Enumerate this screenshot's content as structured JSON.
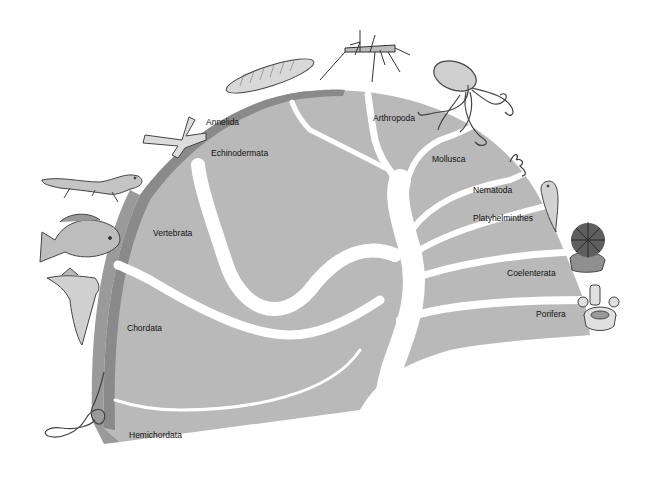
{
  "diagram": {
    "type": "phylogenetic-fan",
    "colors": {
      "fan_fill": "#b9b9b9",
      "outer_band": "#8a8a8a",
      "side_face": "#9e9e9e",
      "branch": "#ffffff",
      "background": "#ffffff"
    },
    "labels": {
      "annelida": "Annelida",
      "arthropoda": "Arthropoda",
      "echinodermata": "Echinodermata",
      "mollusca": "Mollusca",
      "nematoda": "Nematoda",
      "platyhelminthes": "Platyhelminthes",
      "vertebrata": "Vertebrata",
      "coelenterata": "Coelenterata",
      "chordata": "Chordata",
      "porifera": "Porifera",
      "hemichordata": "Hemichordata"
    },
    "illustrations": [
      {
        "name": "earthworm",
        "phylum": "Annelida"
      },
      {
        "name": "mosquito",
        "phylum": "Arthropoda"
      },
      {
        "name": "octopus",
        "phylum": "Mollusca"
      },
      {
        "name": "starfish",
        "phylum": "Echinodermata"
      },
      {
        "name": "roundworm",
        "phylum": "Nematoda"
      },
      {
        "name": "flatworm",
        "phylum": "Platyhelminthes"
      },
      {
        "name": "sea-anemone",
        "phylum": "Coelenterata"
      },
      {
        "name": "sponge",
        "phylum": "Porifera"
      },
      {
        "name": "salamander",
        "phylum": "Vertebrata"
      },
      {
        "name": "fish",
        "phylum": "Vertebrata"
      },
      {
        "name": "bird",
        "phylum": "Vertebrata"
      },
      {
        "name": "acorn-worm",
        "phylum": "Hemichordata"
      }
    ]
  }
}
